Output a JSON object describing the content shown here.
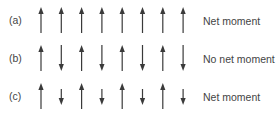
{
  "diagram": {
    "rows": [
      {
        "label": "(a)",
        "note": "Net moment",
        "arrows": [
          "up",
          "up",
          "up",
          "up",
          "up",
          "up",
          "up",
          "up"
        ],
        "lengths": [
          "long",
          "long",
          "long",
          "long",
          "long",
          "long",
          "long",
          "long"
        ]
      },
      {
        "label": "(b)",
        "note": "No net moment",
        "arrows": [
          "up",
          "down",
          "up",
          "down",
          "up",
          "down",
          "up",
          "down"
        ],
        "lengths": [
          "long",
          "long",
          "long",
          "long",
          "long",
          "long",
          "long",
          "long"
        ]
      },
      {
        "label": "(c)",
        "note": "Net moment",
        "arrows": [
          "up",
          "down",
          "up",
          "down",
          "up",
          "down",
          "up",
          "down"
        ],
        "lengths": [
          "long",
          "short",
          "long",
          "short",
          "long",
          "short",
          "long",
          "short"
        ]
      }
    ],
    "colors": {
      "arrow": "#3a3a3a",
      "text": "#444444"
    }
  }
}
